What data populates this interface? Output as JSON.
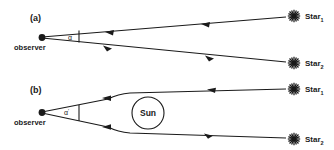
{
  "figure": {
    "caption_type": "two-panel-diagram",
    "background_color": "#ffffff",
    "line_color": "#1a1a1a",
    "width": 334,
    "height": 150
  },
  "panel_a": {
    "label": "(a)",
    "observer_label": "observer",
    "angle_label": "α",
    "angle_prime": "",
    "stars": [
      {
        "name": "Star",
        "subscript": "1",
        "glyph": "starburst-icon"
      },
      {
        "name": "Star",
        "subscript": "2",
        "glyph": "starburst-icon"
      }
    ],
    "ray_shape": "straight",
    "has_sun": false
  },
  "panel_b": {
    "label": "(b)",
    "observer_label": "observer",
    "angle_label": "α",
    "angle_prime": "′",
    "sun_label": "Sun",
    "stars": [
      {
        "name": "Star",
        "subscript": "1",
        "glyph": "starburst-icon"
      },
      {
        "name": "Star",
        "subscript": "2",
        "glyph": "starburst-icon"
      }
    ],
    "ray_shape": "bent",
    "has_sun": true
  }
}
